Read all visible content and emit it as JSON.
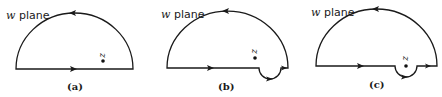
{
  "figure": {
    "panels": [
      {
        "id": "a",
        "caption": "(a)",
        "plane_label_var": "w",
        "plane_label_text": " plane",
        "point_label": "z",
        "contour": "closed semicircle (upper half-disk) traversed counterclockwise; point z lies inside the contour",
        "indentation": "none"
      },
      {
        "id": "b",
        "caption": "(b)",
        "plane_label_var": "w",
        "plane_label_text": " plane",
        "point_label": "z",
        "contour": "upper half-disk traversed counterclockwise with a small semicircular indentation dipping below the real axis, to the right of point z",
        "indentation": "below axis, excluding z's projection"
      },
      {
        "id": "c",
        "caption": "(c)",
        "plane_label_var": "w",
        "plane_label_text": " plane",
        "point_label": "z",
        "contour": "upper half-disk traversed counterclockwise with a small semicircular indentation dipping below the real axis, enclosing point z which lies on the axis",
        "indentation": "below axis, around z"
      }
    ],
    "colors": {
      "stroke": "#1a1a1a",
      "background": "#ffffff"
    }
  }
}
